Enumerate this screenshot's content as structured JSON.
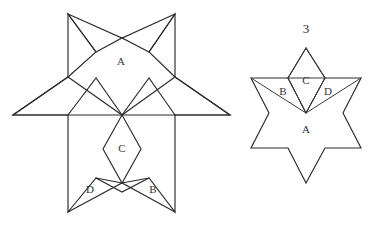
{
  "figure": {
    "caption_number": "3",
    "background_color": "#ffffff",
    "stroke_color": "#2b2b2b",
    "label_color": "#333333"
  },
  "left_star": {
    "name": "dissected-star",
    "labels": {
      "a": "A",
      "b": "B",
      "c": "C",
      "d": "D"
    },
    "label_positions": {
      "a": {
        "x": 121,
        "y": 62
      },
      "b": {
        "x": 153,
        "y": 190
      },
      "c": {
        "x": 122,
        "y": 149
      },
      "d": {
        "x": 90,
        "y": 190
      }
    },
    "outline_points": "68,14 96,52 122,38 149,52 175,14 175,77 230,115 175,115 175,212 149,178 122,192 96,178 68,212 68,115 13,115 68,77",
    "inner_cuts": [
      "68,77 122,115 175,77",
      "68,115 122,115 175,115",
      "68,115 96,78 122,115",
      "122,115 149,78 175,115",
      "122,115 103,149 122,183 141,149 122,115",
      "96,178 122,183 149,178",
      "68,212 122,183 175,212",
      "68,14 96,52 68,77",
      "175,14 149,52 175,77",
      "68,14 122,38 175,14",
      "13,115 68,77",
      "13,115 68,115",
      "230,115 175,77",
      "230,115 175,115"
    ]
  },
  "right_star": {
    "name": "assembled-star",
    "labels": {
      "a": "A",
      "b": "B",
      "c": "C",
      "d": "D"
    },
    "label_positions": {
      "a": {
        "x": 306,
        "y": 130
      },
      "b": {
        "x": 283,
        "y": 92
      },
      "c": {
        "x": 306,
        "y": 81
      },
      "d": {
        "x": 328,
        "y": 92
      }
    },
    "outline_points": "306,48 325,78 361,78 343,113 361,148 325,148 306,183 288,148 251,148 269,113 251,78 288,78",
    "inner_cuts": [
      "288,78 306,113 325,78",
      "288,78 306,78 325,78",
      "306,48 288,78 306,113 325,78 306,48",
      "288,78 306,113",
      "325,78 306,113",
      "251,78 306,113",
      "361,78 306,113"
    ]
  },
  "number_position": {
    "x": 306,
    "y": 30
  }
}
